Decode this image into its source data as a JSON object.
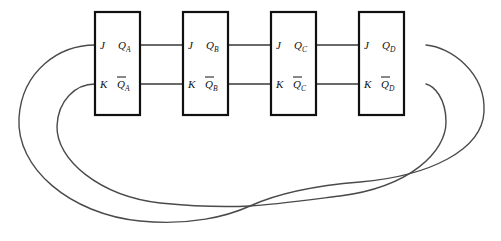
{
  "diagram": {
    "type": "logic-circuit-schematic",
    "background_color": "#ffffff",
    "line_color": "#3a3a3a",
    "box_stroke_color": "#101010",
    "flipflops": [
      {
        "id": "A",
        "input_j": "J",
        "input_k": "K",
        "output_q": "Q",
        "output_q_sub": "A",
        "output_qbar": "Q",
        "output_qbar_sub": "A"
      },
      {
        "id": "B",
        "input_j": "J",
        "input_k": "K",
        "output_q": "Q",
        "output_q_sub": "B",
        "output_qbar": "Q",
        "output_qbar_sub": "B"
      },
      {
        "id": "C",
        "input_j": "J",
        "input_k": "K",
        "output_q": "Q",
        "output_q_sub": "C",
        "output_qbar": "Q",
        "output_qbar_sub": "C"
      },
      {
        "id": "D",
        "input_j": "J",
        "input_k": "K",
        "output_q": "Q",
        "output_q_sub": "D",
        "output_qbar": "Q",
        "output_qbar_sub": "D"
      }
    ],
    "connections": [
      {
        "from": "Q_A",
        "to": "J_B"
      },
      {
        "from": "Qbar_A",
        "to": "K_B"
      },
      {
        "from": "Q_B",
        "to": "J_C"
      },
      {
        "from": "Qbar_B",
        "to": "K_C"
      },
      {
        "from": "Q_C",
        "to": "J_D"
      },
      {
        "from": "Qbar_C",
        "to": "K_D"
      },
      {
        "from": "Q_D",
        "to": "K_A",
        "style": "crossed-feedback-outer"
      },
      {
        "from": "Qbar_D",
        "to": "J_A",
        "style": "crossed-feedback-inner"
      }
    ]
  }
}
